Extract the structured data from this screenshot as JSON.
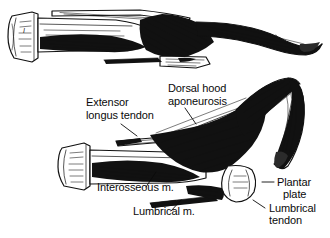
{
  "figure": {
    "background_color": "#ffffff",
    "ink_color": "#111111",
    "panels": [
      {
        "id": "upper",
        "name": "normal-toe-lateral-view",
        "description": "Lateral view of a normal lesser toe: metatarsal shaft with base at left, metatarsophalangeal joint, proximal, middle and distal phalanges extending to the right, with extensor tendon, dorsal hood aponeurosis, interosseous and lumbrical muscles and plantar plate."
      },
      {
        "id": "lower",
        "name": "hammer-toe-deformity-lateral-view",
        "description": "Lateral view of a clawed / hammer toe: metatarsal at left, hyperextended metatarsophalangeal joint, flexed proximal interphalangeal joint with the distal toe curving downward, showing contracted dorsal hood aponeurosis, displaced plantar plate and lumbrical tendon."
      }
    ]
  },
  "labels": [
    {
      "id": "extensor-longus-tendon",
      "lines": [
        "Extensor",
        "longus tendon"
      ],
      "x": 86,
      "y": 106,
      "align": "start",
      "leader": true
    },
    {
      "id": "dorsal-hood-aponeurosis",
      "lines": [
        "Dorsal hood",
        "aponeurosis"
      ],
      "x": 168,
      "y": 92,
      "align": "start",
      "leader": true
    },
    {
      "id": "interosseous-muscle",
      "lines": [
        "Interosseous m."
      ],
      "x": 97,
      "y": 191,
      "align": "start",
      "leader": true
    },
    {
      "id": "lumbrical-muscle",
      "lines": [
        "Lumbrical m."
      ],
      "x": 133,
      "y": 215,
      "align": "start",
      "leader": true
    },
    {
      "id": "plantar-plate",
      "lines": [
        "Plantar",
        "plate"
      ],
      "x": 277,
      "y": 186,
      "align": "start",
      "leader": true
    },
    {
      "id": "lumbrical-tendon",
      "lines": [
        "Lumbrical",
        "tendon"
      ],
      "x": 270,
      "y": 212,
      "align": "start",
      "leader": true
    }
  ],
  "label_text": {
    "extensor_line1": "Extensor",
    "extensor_line2": "longus tendon",
    "dorsal_line1": "Dorsal hood",
    "dorsal_line2": "aponeurosis",
    "interosseous": "Interosseous m.",
    "lumbrical_muscle": "Lumbrical m.",
    "plantar_line1": "Plantar",
    "plantar_line2": "plate",
    "lumbrical_tendon_line1": "Lumbrical",
    "lumbrical_tendon_line2": "tendon"
  }
}
